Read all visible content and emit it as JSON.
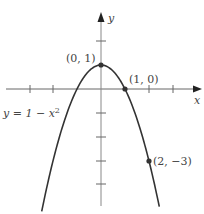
{
  "chart_data": {
    "type": "line",
    "title": "",
    "equation_label": "y = 1 − x²",
    "function": "y = 1 - x^2",
    "xlabel": "x",
    "ylabel": "y",
    "xlim": [
      -4.2,
      4.2
    ],
    "ylim": [
      -5,
      3.7
    ],
    "x_ticks": [
      -3,
      -2,
      2,
      3
    ],
    "y_ticks": [
      2,
      -1,
      -2,
      -3,
      -4
    ],
    "grid": false,
    "points": [
      {
        "x": 0,
        "y": 1,
        "label": "(0, 1)"
      },
      {
        "x": 1,
        "y": 0,
        "label": "(1, 0)"
      },
      {
        "x": 2,
        "y": -3,
        "label": "(2, −3)"
      }
    ],
    "series": [
      {
        "name": "y = 1 − x²",
        "x": [
          -2.45,
          -2,
          -1.5,
          -1,
          -0.5,
          0,
          0.5,
          1,
          1.5,
          2,
          2.45
        ],
        "values": [
          -5.0,
          -3,
          -1.25,
          0,
          0.75,
          1,
          0.75,
          0,
          -1.25,
          -3,
          -5.0
        ]
      }
    ]
  },
  "labels": {
    "x_axis": "x",
    "y_axis": "y",
    "vertex": "(0, 1)",
    "root": "(1, 0)",
    "point": "(2, −3)",
    "equation_prefix": "y = 1 − x",
    "equation_exp": "2"
  },
  "colors": {
    "axis": "#555555",
    "curve": "#333333",
    "text": "#444444"
  }
}
